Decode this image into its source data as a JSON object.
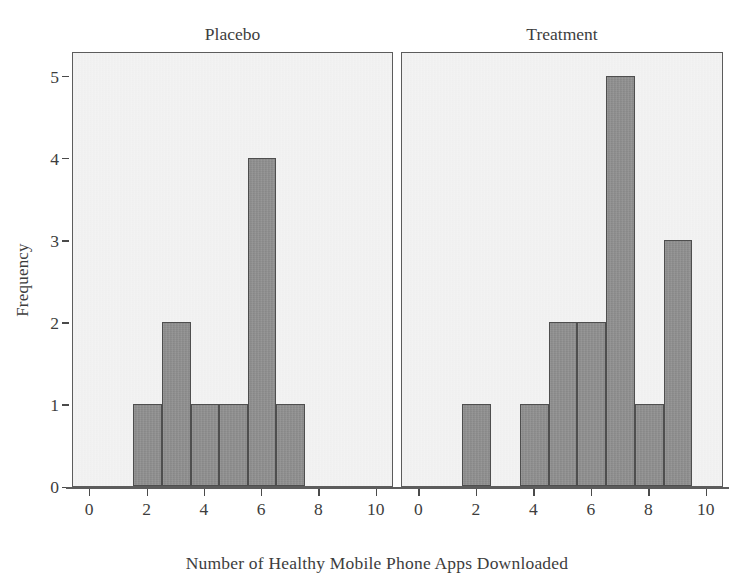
{
  "chart_data": {
    "type": "bar",
    "title": "",
    "xlabel": "Number of Healthy Mobile Phone Apps Downloaded",
    "ylabel": "Frequency",
    "xlim": [
      -0.6,
      10.6
    ],
    "ylim": [
      0,
      5.3
    ],
    "xticks": [
      "0",
      "2",
      "4",
      "6",
      "8",
      "10"
    ],
    "xtick_values": [
      0,
      2,
      4,
      6,
      8,
      10
    ],
    "yticks": [
      "0",
      "1",
      "2",
      "3",
      "4",
      "5"
    ],
    "ytick_values": [
      0,
      1,
      2,
      3,
      4,
      5
    ],
    "grid": false,
    "legend": "none",
    "bin_width": 1,
    "panels": [
      {
        "label": "Placebo",
        "bins": [
          {
            "start": 1.5,
            "end": 2.5,
            "count": 1
          },
          {
            "start": 2.5,
            "end": 3.5,
            "count": 2
          },
          {
            "start": 3.5,
            "end": 4.5,
            "count": 1
          },
          {
            "start": 4.5,
            "end": 5.5,
            "count": 1
          },
          {
            "start": 5.5,
            "end": 6.5,
            "count": 4
          },
          {
            "start": 6.5,
            "end": 7.5,
            "count": 1
          }
        ]
      },
      {
        "label": "Treatment",
        "bins": [
          {
            "start": 1.5,
            "end": 2.5,
            "count": 1
          },
          {
            "start": 3.5,
            "end": 4.5,
            "count": 1
          },
          {
            "start": 4.5,
            "end": 5.5,
            "count": 2
          },
          {
            "start": 5.5,
            "end": 6.5,
            "count": 2
          },
          {
            "start": 6.5,
            "end": 7.5,
            "count": 5
          },
          {
            "start": 7.5,
            "end": 8.5,
            "count": 1
          },
          {
            "start": 8.5,
            "end": 9.5,
            "count": 3
          }
        ]
      }
    ],
    "colors": {
      "bar_fill": "#8d8d8d",
      "bar_stroke": "#4e4e4e",
      "panel_background": "#eeeeee",
      "panel_border": "#5c5c5c",
      "text": "#3d3d3d",
      "figure_background": "#ffffff"
    }
  }
}
